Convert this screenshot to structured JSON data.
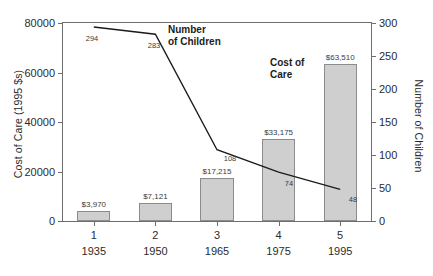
{
  "chart_data": {
    "type": "bar",
    "title": "",
    "xlabel": "",
    "ylabel": "Cost of Care (1995 $s)",
    "y2label": "Number of Children",
    "categories": [
      "1",
      "2",
      "3",
      "4",
      "5"
    ],
    "category_years": [
      "1935",
      "1950",
      "1965",
      "1975",
      "1995"
    ],
    "ylim": [
      0,
      80000
    ],
    "y2lim": [
      0,
      300
    ],
    "yticks": [
      "0",
      "20000",
      "40000",
      "60000",
      "80000"
    ],
    "ytick_values": [
      0,
      20000,
      40000,
      60000,
      80000
    ],
    "y2ticks": [
      "0",
      "50",
      "100",
      "150",
      "200",
      "250",
      "300"
    ],
    "y2tick_values": [
      0,
      50,
      100,
      150,
      200,
      250,
      300
    ],
    "grid": false,
    "legend_position": "inline-annotations",
    "series": [
      {
        "name": "Cost of Care",
        "type": "bar",
        "axis": "left",
        "color": "#cfcfcf",
        "edge_color": "#8c8c8c",
        "values": [
          3970,
          7121,
          17215,
          33175,
          63510
        ],
        "labels": [
          "$3,970",
          "$7,121",
          "$17,215",
          "$33,175",
          "$63,510"
        ]
      },
      {
        "name": "Number of Children",
        "type": "line",
        "axis": "right",
        "color": "#1c1c1c",
        "values": [
          294,
          283,
          108,
          74,
          48
        ],
        "labels": [
          "294",
          "283",
          "108",
          "74",
          "48"
        ]
      }
    ],
    "annotations": [
      {
        "name": "number-of-children",
        "line1": "Number",
        "line2": "of Children"
      },
      {
        "name": "cost-of-care",
        "line1": "Cost of",
        "line2": "Care"
      }
    ]
  },
  "axes": {
    "left_title": "Cost of Care (1995 $s)",
    "right_title": "Number of Children"
  },
  "colors": {
    "bar_fill": "#cfcfcf",
    "bar_edge": "#8c8c8c",
    "line": "#1c1c1c",
    "axis": "#6e6e6e",
    "text": "#2b2b2b",
    "background": "#ffffff"
  }
}
